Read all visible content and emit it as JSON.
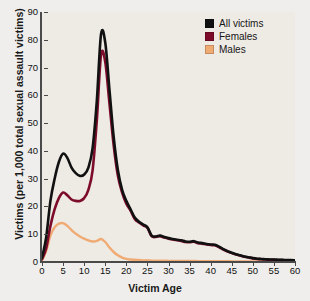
{
  "chart_data": {
    "type": "line",
    "title": "",
    "xlabel": "Victim Age",
    "ylabel": "Victims (per 1,000 total sexual assault victims)",
    "xlim": [
      0,
      60
    ],
    "ylim": [
      0,
      90
    ],
    "xticks": [
      0,
      5,
      10,
      15,
      20,
      25,
      30,
      35,
      40,
      45,
      50,
      55,
      60
    ],
    "yticks": [
      0,
      10,
      20,
      30,
      40,
      50,
      60,
      70,
      80,
      90
    ],
    "grid": false,
    "legend_position": "top-right",
    "x": [
      0,
      1,
      2,
      3,
      4,
      5,
      6,
      7,
      8,
      9,
      10,
      11,
      12,
      13,
      14,
      15,
      16,
      17,
      18,
      19,
      20,
      21,
      22,
      23,
      24,
      25,
      26,
      27,
      28,
      29,
      30,
      31,
      32,
      33,
      34,
      35,
      36,
      37,
      38,
      39,
      40,
      41,
      42,
      43,
      44,
      45,
      46,
      47,
      48,
      49,
      50,
      51,
      52,
      53,
      54,
      55,
      56,
      57,
      58,
      59,
      60
    ],
    "series": [
      {
        "name": "All victims",
        "color": "#111111",
        "values": [
          1.5,
          9,
          22,
          30,
          36,
          39,
          37.5,
          34,
          32,
          31,
          31.5,
          34,
          41,
          58,
          82,
          79,
          62,
          45,
          33,
          26,
          22,
          19,
          16,
          14.5,
          13.5,
          12.5,
          9.5,
          9.2,
          9.5,
          9.0,
          8.6,
          8.3,
          8.0,
          7.8,
          7.4,
          7.3,
          7.5,
          7.0,
          6.8,
          6.5,
          6.3,
          6.2,
          5.5,
          4.6,
          3.9,
          3.3,
          2.8,
          2.4,
          2.0,
          1.7,
          1.4,
          1.2,
          1.1,
          1.0,
          0.9,
          0.9,
          0.8,
          0.8,
          0.7,
          0.7,
          0.6
        ]
      },
      {
        "name": "Females",
        "color": "#7d0c2b",
        "values": [
          1.0,
          5,
          13,
          19,
          23,
          25,
          24,
          22.5,
          22,
          22,
          23,
          26,
          33,
          51,
          74.5,
          72,
          57,
          42,
          31,
          25,
          21,
          18.5,
          15.5,
          14.2,
          13.2,
          12.3,
          9.3,
          9.0,
          9.3,
          8.8,
          8.4,
          8.1,
          7.8,
          7.6,
          7.2,
          7.1,
          7.3,
          6.8,
          6.6,
          6.3,
          6.1,
          6.0,
          5.3,
          4.5,
          3.8,
          3.2,
          2.7,
          2.3,
          1.9,
          1.6,
          1.3,
          1.1,
          1.0,
          0.9,
          0.8,
          0.8,
          0.7,
          0.7,
          0.6,
          0.6,
          0.5
        ]
      },
      {
        "name": "Males",
        "color": "#f0ab74",
        "values": [
          0.6,
          4,
          9.5,
          12.5,
          13.8,
          14.0,
          13.0,
          11.5,
          10.2,
          9.2,
          8.4,
          7.8,
          7.4,
          7.6,
          8.3,
          7.2,
          5.2,
          3.6,
          2.4,
          1.6,
          1.1,
          0.9,
          0.8,
          0.7,
          0.6,
          0.6,
          0.5,
          0.5,
          0.5,
          0.5,
          0.4,
          0.4,
          0.4,
          0.4,
          0.4,
          0.4,
          0.4,
          0.3,
          0.3,
          0.3,
          0.3,
          0.3,
          0.3,
          0.3,
          0.3,
          0.2,
          0.2,
          0.2,
          0.2,
          0.2,
          0.2,
          0.2,
          0.2,
          0.2,
          0.2,
          0.2,
          0.2,
          0.2,
          0.2,
          0.2,
          0.2
        ]
      }
    ],
    "legend": [
      {
        "label": "All victims",
        "color": "#111111"
      },
      {
        "label": "Females",
        "color": "#7d0c2b"
      },
      {
        "label": "Males",
        "color": "#f0ab74"
      }
    ]
  },
  "colors": {
    "page_background": "#efeeec",
    "plot_background": "#eeeae4",
    "axis": "#4a4a4a",
    "text": "#111111"
  }
}
